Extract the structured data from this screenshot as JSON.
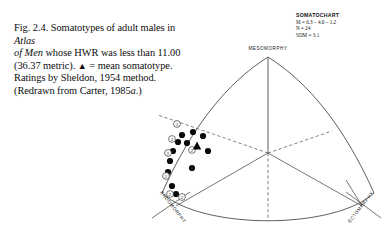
{
  "figure": {
    "caption_lines": [
      "Fig. 2.4. Somatotypes of adult males in Atlas",
      "of Men whose HWR was less than 11.00",
      "(36.37 metric). ▲ = mean somatotype.",
      "Ratings by Sheldon, 1954 method.",
      "(Redrawn from Carter, 1985a.)"
    ],
    "caption_label": "Fig. 2.4.",
    "caption_text": "Fig. 2.4. Somatotypes of adult males in Atlas of Men whose HWR was less than 11.00 (36.37 metric). ▲ = mean somatotype. Ratings by Sheldon, 1954 method. (Redrawn from Carter, 1985a.)",
    "italic_terms": [
      "Atlas of Men",
      "a"
    ],
    "mean_marker_glyph": "▲",
    "mean_marker_meaning": "mean somatotype"
  },
  "legend": {
    "title": "SOMATOCHART",
    "lines": [
      "M = 6.3 – 4.0 – 1.2",
      "N = 24",
      "SDM = 3.1"
    ],
    "mean_somatotype": "6.3 – 4.0 – 1.2",
    "n": "24",
    "sdm": "3.1"
  },
  "chart_data": {
    "type": "scatter",
    "title": "SOMATOCHART",
    "xlabel": "",
    "ylabel": "",
    "grid": false,
    "legend_position": "top-right",
    "axes": [
      {
        "name": "MESOMORPHY",
        "position": "top",
        "rotation": 0
      },
      {
        "name": "ENDOMORPHY",
        "position": "bottom-left",
        "rotation": -52
      },
      {
        "name": "ECTOMORPHY",
        "position": "bottom-right",
        "rotation": 52
      }
    ],
    "axis_labels": {
      "mesomorphy": "MESOMORPHY",
      "endomorphy": "ENDOMORPHY",
      "ectomorphy": "ECTOMORPHY"
    },
    "mean_point": {
      "x": 197,
      "y": 146,
      "label": "mean somatotype",
      "marker": "triangle"
    },
    "points": [
      {
        "x": 182,
        "y": 135,
        "marker": "filled-circle"
      },
      {
        "x": 193,
        "y": 132,
        "marker": "filled-circle"
      },
      {
        "x": 203,
        "y": 136,
        "marker": "filled-circle"
      },
      {
        "x": 178,
        "y": 142,
        "marker": "filled-circle"
      },
      {
        "x": 187,
        "y": 143,
        "marker": "filled-circle"
      },
      {
        "x": 173,
        "y": 151,
        "marker": "filled-circle"
      },
      {
        "x": 208,
        "y": 151,
        "marker": "filled-circle"
      },
      {
        "x": 170,
        "y": 161,
        "marker": "filled-circle"
      },
      {
        "x": 192,
        "y": 168,
        "marker": "filled-circle"
      },
      {
        "x": 168,
        "y": 172,
        "marker": "filled-circle"
      },
      {
        "x": 172,
        "y": 186,
        "marker": "filled-circle"
      },
      {
        "x": 176,
        "y": 194,
        "marker": "filled-circle"
      }
    ],
    "counted_points": [
      {
        "x": 177,
        "y": 124,
        "count": "3",
        "marker": "numbered-circle"
      },
      {
        "x": 172,
        "y": 139,
        "count": "2",
        "marker": "numbered-circle"
      },
      {
        "x": 168,
        "y": 153,
        "count": "2",
        "marker": "numbered-circle"
      },
      {
        "x": 192,
        "y": 150,
        "count": "2",
        "marker": "numbered-circle"
      },
      {
        "x": 166,
        "y": 176,
        "count": "2",
        "marker": "numbered-circle"
      },
      {
        "x": 170,
        "y": 194,
        "count": "2",
        "marker": "numbered-circle"
      },
      {
        "x": 182,
        "y": 197,
        "count": "2",
        "marker": "numbered-circle"
      }
    ]
  }
}
